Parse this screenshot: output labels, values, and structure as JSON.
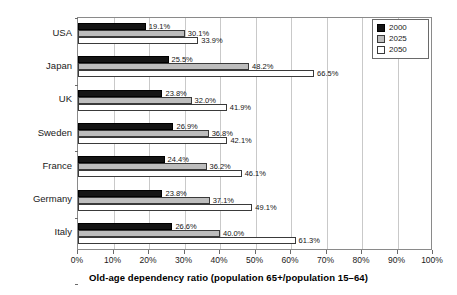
{
  "chart_data": {
    "type": "bar",
    "orientation": "horizontal",
    "title": "",
    "xlabel": "Old-age dependency ratio (population 65+/population 15–64)",
    "ylabel": "",
    "xlim": [
      0,
      100
    ],
    "xtick_labels": [
      "0%",
      "10%",
      "20%",
      "30%",
      "40%",
      "50%",
      "60%",
      "70%",
      "80%",
      "90%",
      "100%"
    ],
    "xticks": [
      0,
      10,
      20,
      30,
      40,
      50,
      60,
      70,
      80,
      90,
      100
    ],
    "grid": "vertical",
    "legend_position": "top-right",
    "categories": [
      "USA",
      "Japan",
      "UK",
      "Sweden",
      "France",
      "Germany",
      "Italy"
    ],
    "series": [
      {
        "name": "2000",
        "color": "#141414",
        "values": [
          19.1,
          25.5,
          23.8,
          26.9,
          24.4,
          23.8,
          26.6
        ],
        "labels": [
          "19.1%",
          "25.5%",
          "23.8%",
          "26.9%",
          "24.4%",
          "23.8%",
          "26.6%"
        ]
      },
      {
        "name": "2025",
        "color": "#bdbdbd",
        "values": [
          30.1,
          48.2,
          32.0,
          36.8,
          36.2,
          37.1,
          40.0
        ],
        "labels": [
          "30.1%",
          "48.2%",
          "32.0%",
          "36.8%",
          "36.2%",
          "37.1%",
          "40.0%"
        ]
      },
      {
        "name": "2050",
        "color": "#ffffff",
        "values": [
          33.9,
          66.5,
          41.9,
          42.1,
          46.1,
          49.1,
          61.3
        ],
        "labels": [
          "33.9%",
          "66.5%",
          "41.9%",
          "42.1%",
          "46.1%",
          "49.1%",
          "61.3%"
        ]
      }
    ]
  },
  "legend": {
    "entries": [
      {
        "label": "2000",
        "swatch": "black-square-icon"
      },
      {
        "label": "2025",
        "swatch": "gray-square-icon"
      },
      {
        "label": "2050",
        "swatch": "white-square-icon"
      }
    ]
  },
  "axis": {
    "x_title": "Old-age dependency ratio (population 65+/population 15–64)"
  }
}
